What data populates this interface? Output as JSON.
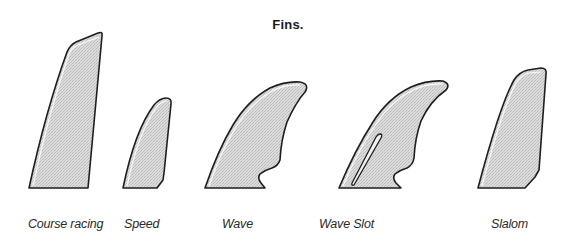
{
  "title": "Fins.",
  "fill_color": "#d4d4d4",
  "stroke_color": "#1e1e1e",
  "fins": [
    {
      "id": "course-racing",
      "label": "Course racing",
      "label_x": 28
    },
    {
      "id": "speed",
      "label": "Speed",
      "label_x": 124
    },
    {
      "id": "wave",
      "label": "Wave",
      "label_x": 222
    },
    {
      "id": "wave-slot",
      "label": "Wave Slot",
      "label_x": 319,
      "has_slot": true
    },
    {
      "id": "slalom",
      "label": "Slalom",
      "label_x": 491
    }
  ]
}
